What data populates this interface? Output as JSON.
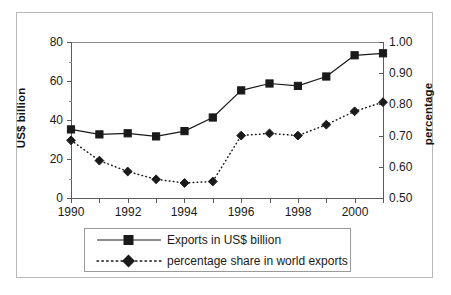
{
  "chart_data": {
    "type": "line",
    "title": "",
    "xlabel": "",
    "ylabel": "US$ billion",
    "y2label": "percentage",
    "grid": false,
    "legend_position": "bottom",
    "x": [
      1990,
      1991,
      1992,
      1993,
      1994,
      1995,
      1996,
      1997,
      1998,
      1999,
      2000,
      2001
    ],
    "x_tick_labels": [
      "1990",
      "1992",
      "1994",
      "1996",
      "1998",
      "2000"
    ],
    "x_tick_values": [
      1990,
      1992,
      1994,
      1996,
      1998,
      2000
    ],
    "ylim": [
      0,
      80
    ],
    "y_tick_labels": [
      "0",
      "20",
      "40",
      "60",
      "80"
    ],
    "y_tick_values": [
      0,
      20,
      40,
      60,
      80
    ],
    "y2lim": [
      0.5,
      1.0
    ],
    "y2_tick_labels": [
      "0.50",
      "0.60",
      "0.70",
      "0.80",
      "0.90",
      "1.00"
    ],
    "y2_tick_values": [
      0.5,
      0.6,
      0.7,
      0.8,
      0.9,
      1.0
    ],
    "series": [
      {
        "name": "Exports in US$ billion",
        "axis": "left",
        "marker": "square",
        "line_style": "solid",
        "color": "#1a1a1a",
        "values": [
          35.2,
          32.6,
          33.2,
          31.6,
          34.3,
          41.3,
          55.2,
          58.7,
          57.5,
          62.3,
          73.2,
          74.2
        ]
      },
      {
        "name": "percentage share in world exports",
        "axis": "right",
        "marker": "diamond",
        "line_style": "dotted",
        "color": "#1a1a1a",
        "values": [
          0.685,
          0.62,
          0.585,
          0.56,
          0.548,
          0.553,
          0.7,
          0.707,
          0.7,
          0.735,
          0.778,
          0.807
        ]
      }
    ]
  },
  "legend": {
    "items": [
      {
        "label": "Exports in US$ billion",
        "marker": "square",
        "line_style": "solid"
      },
      {
        "label": "percentage share in world exports",
        "marker": "diamond",
        "line_style": "dotted"
      }
    ]
  },
  "axes": {
    "left_title": "US$ billion",
    "right_title": "percentage"
  }
}
